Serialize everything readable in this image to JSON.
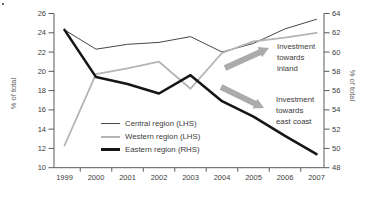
{
  "chart_data": {
    "type": "line",
    "title": "",
    "x": [
      1999,
      2000,
      2001,
      2002,
      2003,
      2004,
      2005,
      2006,
      2007
    ],
    "series": [
      {
        "name": "Central region (LHS)",
        "axis": "left",
        "color": "#474747",
        "stroke_width": 1,
        "values": [
          24.3,
          22.3,
          22.8,
          23.0,
          23.6,
          22.0,
          22.9,
          24.4,
          25.4
        ]
      },
      {
        "name": "Western region (LHS)",
        "axis": "left",
        "color": "#b4b4b4",
        "stroke_width": 1.8,
        "values": [
          12.3,
          19.7,
          20.3,
          21.0,
          18.2,
          21.9,
          23.1,
          23.5,
          24.0
        ]
      },
      {
        "name": "Eastern region (RHS)",
        "axis": "right",
        "color": "#161616",
        "stroke_width": 2.6,
        "values": [
          62.3,
          57.4,
          56.7,
          55.7,
          57.6,
          54.9,
          53.3,
          51.3,
          49.4
        ]
      }
    ],
    "left_axis": {
      "label": "% of total",
      "min": 10,
      "max": 26,
      "tick_step": 2
    },
    "right_axis": {
      "label": "% of total",
      "min": 48,
      "max": 64,
      "tick_step": 2
    },
    "x_axis": {
      "tick_labels": [
        "1999",
        "2000",
        "2001",
        "2002",
        "2003",
        "2004",
        "2005",
        "2006",
        "2007"
      ]
    },
    "grid": false,
    "legend_position": "inside-bottom-left",
    "annotations": [
      {
        "lines": [
          "Investment",
          "towards",
          "inland"
        ],
        "arrow": "up-right"
      },
      {
        "lines": [
          "Investment",
          "towards",
          "east coast"
        ],
        "arrow": "down-right"
      }
    ]
  },
  "colors": {
    "arrow": "#ababab",
    "axis": "#5a5a5a",
    "tick_text": "#3d3d3d",
    "background": "#ffffff"
  }
}
